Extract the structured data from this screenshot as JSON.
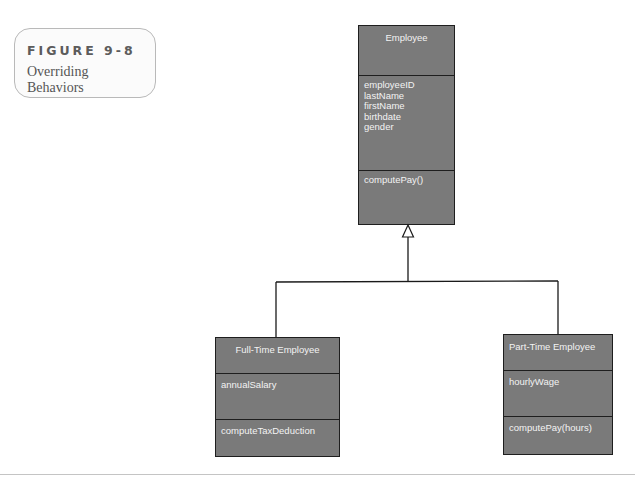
{
  "figure": {
    "number": "FIGURE 9-8",
    "caption": "Overriding Behaviors"
  },
  "diagram": {
    "type": "UML class diagram (inheritance)",
    "superclass": {
      "name": "Employee",
      "attributes": [
        "employeeID",
        "lastName",
        "firstName",
        "birthdate",
        "gender"
      ],
      "methods": [
        "computePay()"
      ]
    },
    "subclasses": [
      {
        "name": "Full-Time Employee",
        "attributes": [
          "annualSalary"
        ],
        "methods": [
          "computeTaxDeduction"
        ]
      },
      {
        "name": "Part-Time Employee",
        "attributes": [
          "hourlyWage"
        ],
        "methods": [
          "computePay(hours)"
        ]
      }
    ],
    "relationship": "generalization",
    "colors": {
      "box_fill": "#7a7a7a",
      "box_border": "#1e1e1e",
      "box_text": "#f3f3f3",
      "connector": "#1a1a1a"
    }
  }
}
